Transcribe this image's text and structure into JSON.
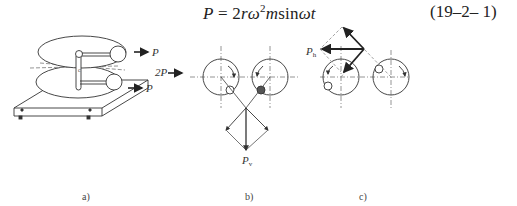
{
  "equation": {
    "formula": "P = 2rω²msinωt",
    "formula_parts": {
      "lhs": "P",
      "eq": " = 2",
      "r": "r",
      "omega": "ω",
      "sq": "2",
      "m": "m",
      "sin": "sin",
      "omega2": "ω",
      "t": "t"
    },
    "number": "(19–2– 1)"
  },
  "figure": {
    "panels": [
      {
        "id": "a",
        "caption": "a)",
        "labels": {
          "top_force": "P",
          "bottom_force": "P",
          "center_mark": "c"
        }
      },
      {
        "id": "b",
        "caption": "b)",
        "labels": {
          "input_force": "2P",
          "resultant": "P",
          "resultant_sub": "v"
        }
      },
      {
        "id": "c",
        "caption": "c)",
        "labels": {
          "resultant": "P",
          "resultant_sub": "h"
        }
      }
    ]
  },
  "colors": {
    "line": "#333333",
    "dash": "#888888",
    "background": "#ffffff"
  }
}
